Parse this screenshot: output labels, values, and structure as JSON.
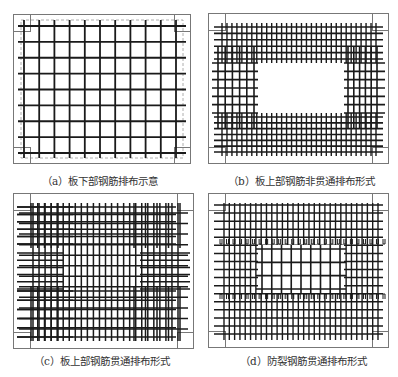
{
  "figure": {
    "top_cut_text": "",
    "panels": [
      {
        "id": "a",
        "caption": "（a）板下部钢筋排布示意",
        "type": "bottom-through",
        "box": {
          "x": 13,
          "y": 14,
          "w": 178,
          "h": 150
        },
        "caption_pos": {
          "x": 42,
          "y": 173
        }
      },
      {
        "id": "b",
        "caption": "（b）板上部钢筋非贯通排布形式",
        "type": "top-non-through",
        "box": {
          "x": 208,
          "y": 13,
          "w": 181,
          "h": 151
        },
        "caption_pos": {
          "x": 228,
          "y": 173
        }
      },
      {
        "id": "c",
        "caption": "（c）板上部钢筋贯通排布形式",
        "type": "top-through",
        "box": {
          "x": 13,
          "y": 193,
          "w": 181,
          "h": 156
        },
        "caption_pos": {
          "x": 34,
          "y": 353
        }
      },
      {
        "id": "d",
        "caption": "（d）防裂钢筋贯通排布形式",
        "type": "anti-crack-through",
        "box": {
          "x": 208,
          "y": 193,
          "w": 181,
          "h": 155
        },
        "caption_pos": {
          "x": 240,
          "y": 353
        }
      }
    ],
    "colors": {
      "rebar": "#1a1a1a",
      "border": "#777777",
      "dashed": "#999999",
      "caption": "#333333"
    }
  }
}
